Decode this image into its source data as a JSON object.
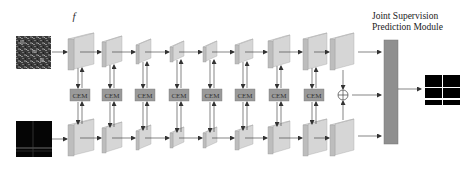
{
  "module_title_line1": "Joint Supervision",
  "module_title_line2": "Prediction Module",
  "cem_label": "CEM",
  "fusion_symbol": "⊕",
  "top_stream": {
    "input": "rgb-texture-image-icon",
    "features": [
      {
        "base": "f",
        "sub": "I",
        "sup": "1"
      },
      {
        "base": "f",
        "sub": "I",
        "sup": "2"
      },
      {
        "base": "f",
        "sub": "I",
        "sup": "3"
      },
      {
        "base": "f",
        "sub": "I",
        "sup": "4"
      },
      {
        "base": "f",
        "sub": "I",
        "sup": "5"
      },
      {
        "base": "f",
        "sub": "I",
        "sup": "6"
      },
      {
        "base": "f",
        "sub": "I",
        "sup": "7"
      },
      {
        "base": "f",
        "sub": "I",
        "sup": "8"
      },
      {
        "base": "f",
        "sub": "I",
        "sup": "o"
      }
    ]
  },
  "bottom_stream": {
    "input": "thermal-dark-image-icon",
    "features": [
      {
        "base": "f",
        "sub": "T",
        "sup": "1"
      },
      {
        "base": "f",
        "sub": "T",
        "sup": "2"
      },
      {
        "base": "f",
        "sub": "T",
        "sup": "3"
      },
      {
        "base": "f",
        "sub": "T",
        "sup": "4"
      },
      {
        "base": "f",
        "sub": "T",
        "sup": "5"
      },
      {
        "base": "f",
        "sub": "T",
        "sup": "6"
      },
      {
        "base": "f",
        "sub": "T",
        "sup": "7"
      },
      {
        "base": "f",
        "sub": "T",
        "sup": "8"
      },
      {
        "base": "f",
        "sub": "T",
        "sup": "o"
      }
    ]
  },
  "colors": {
    "block_front": "#d6d6d6",
    "block_side": "#bdbdbd",
    "block_top": "#e6e6e6",
    "cem_fill": "#9a9a9a",
    "bar_fill": "#8f8f8f",
    "arrow": "#333333"
  }
}
